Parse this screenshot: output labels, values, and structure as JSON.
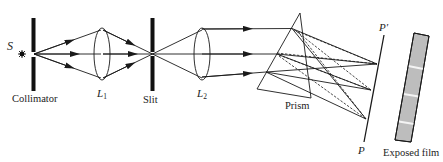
{
  "diagram": {
    "type": "optical-schematic",
    "labels": {
      "source": "S",
      "collimator": "Collimator",
      "lens1": "L",
      "lens1_sub": "1",
      "slit": "Slit",
      "lens2": "L",
      "lens2_sub": "2",
      "prism": "Prism",
      "plate_top": "P′",
      "plate_bottom": "P",
      "film": "Exposed film"
    },
    "colors": {
      "line": "#1a1a1a",
      "film_fill": "#bdbdbd",
      "film_line": "#f4f4f4"
    },
    "film_bands": 3
  }
}
